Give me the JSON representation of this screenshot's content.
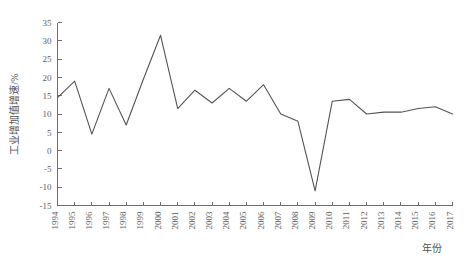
{
  "chart_data": {
    "type": "line",
    "title": "",
    "subtitle": "",
    "xlabel": "年份",
    "ylabel": "工业增加值增速/%",
    "xlim": [
      1994,
      2017
    ],
    "ylim": [
      -15,
      35
    ],
    "grid": false,
    "legend": null,
    "legend_position": "none",
    "line_color": "#55544f",
    "axis_color": "#6e6e6e",
    "y_ticks": [
      -15,
      -10,
      -5,
      0,
      5,
      10,
      15,
      20,
      25,
      30,
      35
    ],
    "y_tick_labels": [
      "-15",
      "-10",
      "-5",
      "0",
      "5",
      "10",
      "15",
      "20",
      "25",
      "30",
      "35"
    ],
    "categories": [
      "1994",
      "1995",
      "1996",
      "1997",
      "1998",
      "1999",
      "2000",
      "2001",
      "2002",
      "2003",
      "2004",
      "2005",
      "2006",
      "2007",
      "2008",
      "2009",
      "2010",
      "2011",
      "2012",
      "2013",
      "2014",
      "2015",
      "2016",
      "2017"
    ],
    "x": [
      1994,
      1995,
      1996,
      1997,
      1998,
      1999,
      2000,
      2001,
      2002,
      2003,
      2004,
      2005,
      2006,
      2007,
      2008,
      2009,
      2010,
      2011,
      2012,
      2013,
      2014,
      2015,
      2016,
      2017
    ],
    "values": [
      14.5,
      19.0,
      4.5,
      17.0,
      7.0,
      19.5,
      31.5,
      11.5,
      16.5,
      13.0,
      17.0,
      13.5,
      18.0,
      10.0,
      8.0,
      -11.0,
      13.5,
      14.0,
      10.0,
      10.5,
      10.5,
      11.5,
      12.0,
      10.0
    ],
    "series": [
      {
        "name": "工业增加值增速",
        "values": [
          14.5,
          19.0,
          4.5,
          17.0,
          7.0,
          19.5,
          31.5,
          11.5,
          16.5,
          13.0,
          17.0,
          13.5,
          18.0,
          10.0,
          8.0,
          -11.0,
          13.5,
          14.0,
          10.0,
          10.5,
          10.5,
          11.5,
          12.0,
          10.0
        ]
      }
    ]
  }
}
